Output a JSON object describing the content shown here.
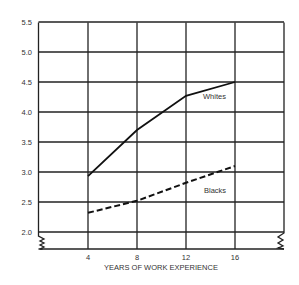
{
  "chart_data": {
    "type": "line",
    "title": "",
    "xlabel": "YEARS OF WORK EXPERIENCE",
    "ylabel": "",
    "x": [
      4,
      8,
      12,
      16
    ],
    "x_ticks": [
      "4",
      "8",
      "12",
      "16"
    ],
    "y_ticks": [
      "2.0",
      "2.5",
      "3.0",
      "3.5",
      "4.0",
      "4.5",
      "5.0",
      "5.5"
    ],
    "ylim": [
      2.0,
      5.5
    ],
    "grid": true,
    "axis_break": true,
    "series": [
      {
        "name": "Whites",
        "style": "solid",
        "values": [
          2.93,
          3.7,
          4.27,
          4.5
        ]
      },
      {
        "name": "Blacks",
        "style": "dashed",
        "values": [
          2.32,
          2.52,
          2.82,
          3.1
        ]
      }
    ],
    "annotations": [
      "Whites",
      "Blacks"
    ]
  }
}
